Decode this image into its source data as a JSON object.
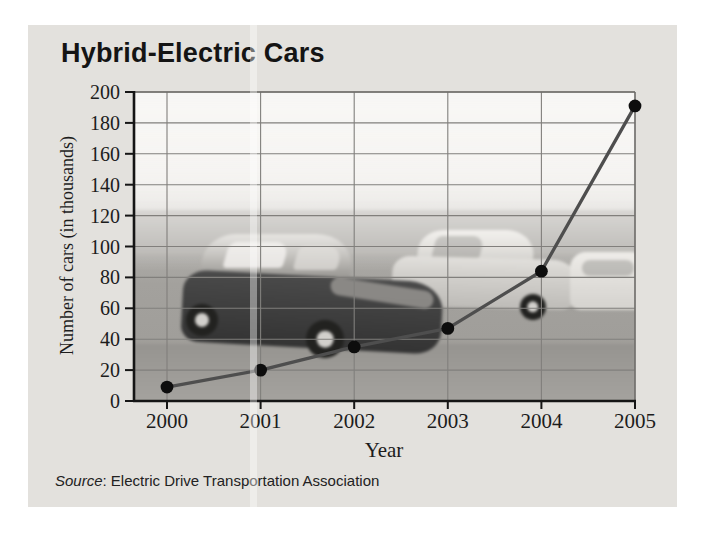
{
  "figure": {
    "title": "Hybrid-Electric Cars",
    "source_italic": "Source",
    "source_rest": ": Electric Drive Transportation Association"
  },
  "chart_data": {
    "type": "line",
    "title": "Hybrid-Electric Cars",
    "x": [
      "2000",
      "2001",
      "2002",
      "2003",
      "2004",
      "2005"
    ],
    "values": [
      9,
      20,
      35,
      47,
      84,
      191
    ],
    "xlabel": "Year",
    "ylabel": "Number of cars (in thousands)",
    "ylim": [
      0,
      200
    ],
    "yticks": [
      0,
      20,
      40,
      60,
      80,
      100,
      120,
      140,
      160,
      180,
      200
    ],
    "grid": true,
    "legend": "none",
    "line_color": "#4e4e4e",
    "marker_color": "#0d0d0d",
    "grid_color": "#817f7c",
    "axis_color": "#151515",
    "source": "Source: Electric Drive Transportation Association"
  }
}
